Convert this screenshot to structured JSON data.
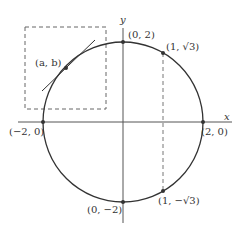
{
  "diagram": {
    "axes": {
      "x_label": "x",
      "y_label": "y"
    },
    "circle": {
      "center": [
        0,
        0
      ],
      "radius": 2
    },
    "points": [
      {
        "id": "top",
        "label": "(0, 2)"
      },
      {
        "id": "q1",
        "label": "(1, √3)"
      },
      {
        "id": "right",
        "label": "(2, 0)"
      },
      {
        "id": "left",
        "label": "(−2, 0)"
      },
      {
        "id": "bottom",
        "label": "(0, −2)"
      },
      {
        "id": "q4",
        "label": "(1, −√3)"
      },
      {
        "id": "ab",
        "label": "(a, b)"
      }
    ],
    "annotations": {
      "tangent_line": "tangent at (a, b)",
      "zoom_box": "dashed box around (a, b)",
      "vertical_dashed": "dashed line x = 1"
    },
    "colors": {
      "ink": "#333333",
      "dash": "#666666"
    }
  }
}
